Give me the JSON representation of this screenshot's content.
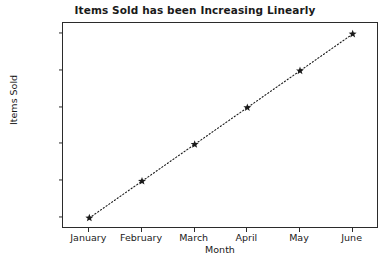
{
  "chart_data": {
    "type": "line",
    "title": "Items Sold has been Increasing Linearly",
    "xlabel": "Month",
    "ylabel": "Items Sold",
    "categories": [
      "January",
      "February",
      "March",
      "April",
      "May",
      "June"
    ],
    "values": [
      1000,
      1200,
      1400,
      1600,
      1800,
      2000
    ],
    "series": [
      {
        "name": "Items Sold",
        "values": [
          1000,
          1200,
          1400,
          1600,
          1800,
          2000
        ]
      }
    ],
    "yticks": [
      1000,
      1200,
      1400,
      1600,
      1800,
      2000
    ],
    "ytick_labels": [
      "1000",
      "1200",
      "1400",
      "1600",
      "1800",
      "2000"
    ],
    "ylim": [
      940,
      2060
    ],
    "grid": false,
    "legend": false,
    "line_style": "dotted",
    "marker": "star",
    "line_color": "#1a1a1a",
    "marker_color": "#1a1a1a",
    "background_color": "#ffffff",
    "axis_color": "#2b2b2b"
  }
}
